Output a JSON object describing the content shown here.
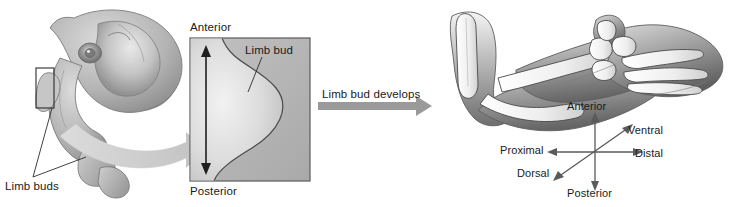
{
  "figure": {
    "background_color": "#ffffff",
    "width": 732,
    "height": 207
  },
  "panels": {
    "embryo": {
      "name": "embryo-illustration",
      "limb_buds_label": "Limb buds",
      "highlight_box": "limb bud region outline"
    },
    "limb_bud_closeup": {
      "name": "limb-bud-closeup-panel",
      "anterior_label": "Anterior",
      "posterior_label": "Posterior",
      "limb_bud_label": "Limb bud",
      "panel_fill": "#b8b8b8",
      "bud_fill": "#e8e8e8",
      "border_color": "#5a5a5a"
    },
    "developed_limb": {
      "name": "developed-limb-illustration",
      "axes": {
        "anterior": "Anterior",
        "posterior": "Posterior",
        "proximal": "Proximal",
        "distal": "Distal",
        "ventral": "Ventral",
        "dorsal": "Dorsal"
      }
    }
  },
  "transitions": {
    "magnify_arrow": {
      "name": "magnify-curved-arrow",
      "label": "",
      "color": "#cfcfcf"
    },
    "develops_arrow": {
      "name": "develops-arrow",
      "label": "Limb bud develops",
      "color": "#9a9a9a"
    }
  },
  "colors": {
    "arrow_light": "#cfcfcf",
    "arrow_mid": "#9a9a9a",
    "text": "#1a1a1a",
    "outline": "#333333"
  }
}
